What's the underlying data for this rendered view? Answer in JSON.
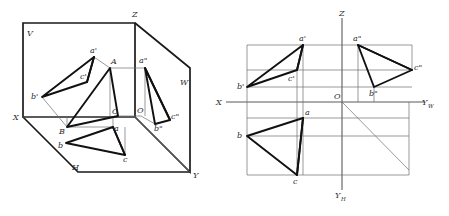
{
  "figure": {
    "background_color": "#ffffff",
    "line_color": "#111111",
    "thin_line_color": "#6e6e6e",
    "axis_color": "#5a5a5a"
  },
  "left_diagram": {
    "name": "pictorial-projection-box",
    "plane_labels": {
      "v_plane": "V",
      "h_plane": "H",
      "w_plane": "W"
    },
    "axis_labels": {
      "x": "X",
      "y": "Y",
      "z": "Z",
      "origin": "O"
    },
    "space_points": {
      "A": "A",
      "B": "B",
      "C": "C"
    },
    "front_view_points": {
      "a_prime": "a'",
      "b_prime": "b'",
      "c_prime": "c'"
    },
    "top_view_points": {
      "a": "a",
      "b": "b",
      "c": "c"
    },
    "side_view_points": {
      "a_double_prime": "a\"",
      "b_double_prime": "b\"",
      "c_double_prime": "c\""
    }
  },
  "right_diagram": {
    "name": "unfolded-three-view-drawing",
    "axis_labels": {
      "x": "X",
      "z": "Z",
      "y_w": "Y",
      "y_w_sub": "W",
      "y_h": "Y",
      "y_h_sub": "H",
      "origin": "O"
    },
    "front_view_points": {
      "a_prime": "a'",
      "b_prime": "b'",
      "c_prime": "c'"
    },
    "top_view_points": {
      "a": "a",
      "b": "b",
      "c": "c"
    },
    "side_view_points": {
      "a_double_prime": "a\"",
      "b_double_prime": "b\"",
      "c_double_prime": "c\""
    }
  }
}
